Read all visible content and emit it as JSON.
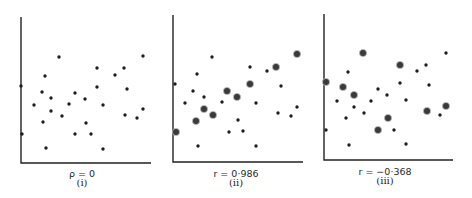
{
  "figure": {
    "panels": [
      {
        "id": "i",
        "caption": "(i)",
        "stat_label": "ρ = 0",
        "axes": {
          "origin": [
            21,
            163
          ],
          "top": 17,
          "right": 151
        },
        "stat_pos": [
          82,
          170
        ],
        "caption_pos": [
          82,
          186
        ],
        "points": [
          [
            59,
            57,
            0
          ],
          [
            143,
            56,
            0
          ],
          [
            97,
            68,
            0
          ],
          [
            124,
            68,
            0
          ],
          [
            115,
            75,
            0
          ],
          [
            45,
            76,
            0
          ],
          [
            21,
            86,
            0
          ],
          [
            97,
            87,
            0
          ],
          [
            127,
            89,
            0
          ],
          [
            42,
            92,
            0
          ],
          [
            75,
            93,
            0
          ],
          [
            51,
            98,
            0
          ],
          [
            85,
            99,
            0
          ],
          [
            34,
            105,
            0
          ],
          [
            69,
            104,
            0
          ],
          [
            103,
            105,
            0
          ],
          [
            143,
            109,
            0
          ],
          [
            51,
            111,
            0
          ],
          [
            62,
            116,
            0
          ],
          [
            125,
            115,
            0
          ],
          [
            137,
            118,
            0
          ],
          [
            43,
            122,
            0
          ],
          [
            86,
            123,
            0
          ],
          [
            22,
            134,
            0
          ],
          [
            75,
            134,
            0
          ],
          [
            91,
            134,
            0
          ],
          [
            46,
            148,
            0
          ],
          [
            103,
            149,
            0
          ]
        ]
      },
      {
        "id": "ii",
        "caption": "(ii)",
        "stat_label": "r = 0·986",
        "axes": {
          "origin": [
            173,
            162
          ],
          "top": 15,
          "right": 303
        },
        "stat_pos": [
          236,
          170
        ],
        "caption_pos": [
          236,
          186
        ],
        "points": [
          [
            212,
            57,
            0
          ],
          [
            297,
            54,
            1
          ],
          [
            250,
            67,
            0
          ],
          [
            276,
            67,
            1
          ],
          [
            267,
            71,
            0
          ],
          [
            197,
            74,
            0
          ],
          [
            175,
            84,
            0
          ],
          [
            250,
            84,
            1
          ],
          [
            281,
            86,
            0
          ],
          [
            193,
            91,
            0
          ],
          [
            227,
            91,
            1
          ],
          [
            204,
            97,
            0
          ],
          [
            237,
            97,
            1
          ],
          [
            185,
            103,
            0
          ],
          [
            222,
            102,
            0
          ],
          [
            256,
            103,
            0
          ],
          [
            297,
            107,
            0
          ],
          [
            204,
            109,
            1
          ],
          [
            213,
            115,
            1
          ],
          [
            278,
            113,
            0
          ],
          [
            291,
            116,
            0
          ],
          [
            196,
            121,
            1
          ],
          [
            238,
            120,
            0
          ],
          [
            176,
            132,
            1
          ],
          [
            229,
            132,
            0
          ],
          [
            243,
            131,
            0
          ],
          [
            198,
            146,
            0
          ],
          [
            256,
            146,
            0
          ]
        ]
      },
      {
        "id": "iii",
        "caption": "(iii)",
        "stat_label": "r = −0·368",
        "axes": {
          "origin": [
            324,
            160
          ],
          "top": 14,
          "right": 453
        },
        "stat_pos": [
          385,
          168
        ],
        "caption_pos": [
          385,
          184
        ],
        "points": [
          [
            363,
            53,
            1
          ],
          [
            446,
            53,
            0
          ],
          [
            400,
            65,
            1
          ],
          [
            426,
            65,
            0
          ],
          [
            417,
            71,
            0
          ],
          [
            348,
            72,
            0
          ],
          [
            326,
            82,
            1
          ],
          [
            400,
            83,
            0
          ],
          [
            429,
            85,
            0
          ],
          [
            343,
            87,
            1
          ],
          [
            378,
            89,
            0
          ],
          [
            354,
            95,
            1
          ],
          [
            387,
            95,
            0
          ],
          [
            337,
            101,
            0
          ],
          [
            371,
            101,
            0
          ],
          [
            406,
            100,
            0
          ],
          [
            446,
            106,
            1
          ],
          [
            354,
            107,
            0
          ],
          [
            364,
            113,
            0
          ],
          [
            427,
            111,
            1
          ],
          [
            440,
            115,
            0
          ],
          [
            346,
            118,
            0
          ],
          [
            388,
            118,
            1
          ],
          [
            326,
            130,
            0
          ],
          [
            378,
            130,
            1
          ],
          [
            394,
            130,
            0
          ],
          [
            349,
            145,
            0
          ],
          [
            406,
            144,
            0
          ]
        ]
      }
    ],
    "legend_note": "large ringed dots mark the highlighted sample points"
  }
}
